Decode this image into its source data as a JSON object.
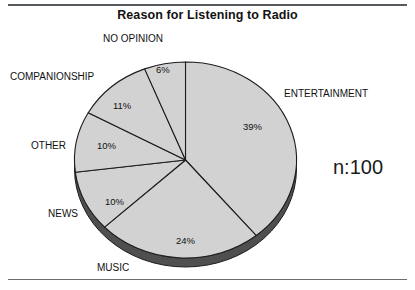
{
  "chart_title": "Reason for Listening to Radio",
  "annotation": {
    "sample_size_label": "n:100"
  },
  "chart_data": {
    "type": "pie",
    "title": "Reason for Listening to Radio",
    "xlabel": "",
    "ylabel": "",
    "categories": [
      "ENTERTAINMENT",
      "MUSIC",
      "NEWS",
      "OTHER",
      "COMPANIONSHIP",
      "NO OPINION"
    ],
    "values": [
      39,
      24,
      10,
      10,
      11,
      6
    ],
    "value_labels": [
      "39%",
      "24%",
      "10%",
      "10%",
      "11%",
      "6%"
    ],
    "units": "percent",
    "total": 100,
    "sample_size": 100,
    "start_angle_deg": 0,
    "direction": "clockwise",
    "legend": "none",
    "grid": false,
    "style": "3d-ellipse-single-fill",
    "colors": {
      "slice_fill": "#d2d2d2",
      "slice_outline": "#1c1c1c",
      "depth_shadow": "#4f4f4f",
      "text": "#111111"
    },
    "slices": [
      {
        "label": "ENTERTAINMENT",
        "value": 39,
        "value_label": "39%"
      },
      {
        "label": "MUSIC",
        "value": 24,
        "value_label": "24%"
      },
      {
        "label": "NEWS",
        "value": 10,
        "value_label": "10%"
      },
      {
        "label": "OTHER",
        "value": 10,
        "value_label": "10%"
      },
      {
        "label": "COMPANIONSHIP",
        "value": 11,
        "value_label": "11%"
      },
      {
        "label": "NO OPINION",
        "value": 6,
        "value_label": "6%"
      }
    ]
  },
  "pct_labels": [
    {
      "text": "6%",
      "left": 156,
      "top": 64
    },
    {
      "text": "11%",
      "left": 113,
      "top": 100
    },
    {
      "text": "10%",
      "left": 97,
      "top": 140
    },
    {
      "text": "10%",
      "left": 105,
      "top": 196
    },
    {
      "text": "24%",
      "left": 176,
      "top": 235
    },
    {
      "text": "39%",
      "left": 243,
      "top": 121
    }
  ],
  "cat_labels": [
    {
      "text": "NO OPINION",
      "left": 103,
      "top": 33
    },
    {
      "text": "COMPANIONSHIP",
      "left": 10,
      "top": 71
    },
    {
      "text": "OTHER",
      "left": 31,
      "top": 140
    },
    {
      "text": "NEWS",
      "left": 48,
      "top": 208
    },
    {
      "text": "MUSIC",
      "left": 97,
      "top": 262
    },
    {
      "text": "ENTERTAINMENT",
      "left": 284,
      "top": 88
    }
  ]
}
